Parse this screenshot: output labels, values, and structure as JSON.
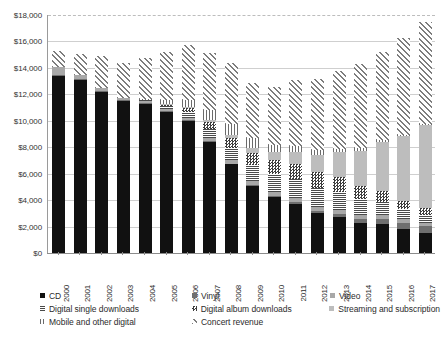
{
  "chart_data": {
    "type": "bar",
    "stacked": true,
    "title": "",
    "subtitle": "",
    "xlabel": "",
    "ylabel": "",
    "ylim": [
      0,
      18000
    ],
    "ytick_step": 2000,
    "grid": true,
    "legend_position": "bottom",
    "y_ticks": [
      "$0",
      "$2,000",
      "$4,000",
      "$6,000",
      "$8,000",
      "$10,000",
      "$12,000",
      "$14,000",
      "$16,000",
      "$18,000"
    ],
    "categories": [
      "2000",
      "2001",
      "2002",
      "2003",
      "2004",
      "2005",
      "2006",
      "2007",
      "2008",
      "2009",
      "2010",
      "2011",
      "2012",
      "2013",
      "2014",
      "2015",
      "2016",
      "2017"
    ],
    "series": [
      {
        "name": "CD",
        "pattern": "solid-black",
        "color": "#111111",
        "values": [
          13400,
          13100,
          12200,
          11500,
          11300,
          10700,
          10000,
          8400,
          6700,
          5100,
          4200,
          3700,
          3000,
          2700,
          2300,
          2200,
          1800,
          1500
        ]
      },
      {
        "name": "Vinyl",
        "pattern": "solid-dark-gray",
        "color": "#6f6f6f",
        "values": [
          60,
          60,
          50,
          50,
          40,
          40,
          40,
          50,
          60,
          80,
          100,
          130,
          180,
          230,
          300,
          400,
          450,
          520
        ]
      },
      {
        "name": "Video",
        "pattern": "solid-gray",
        "color": "#a8a8a8",
        "values": [
          640,
          320,
          260,
          200,
          180,
          180,
          200,
          250,
          270,
          280,
          300,
          330,
          320,
          300,
          300,
          300,
          300,
          280
        ]
      },
      {
        "name": "Digital single downloads",
        "pattern": "horizontal-lines",
        "color": "#4a4a4a",
        "values": [
          0,
          0,
          0,
          0,
          30,
          180,
          420,
          700,
          950,
          1200,
          1350,
          1450,
          1450,
          1350,
          1150,
          950,
          750,
          600
        ]
      },
      {
        "name": "Digital album downloads",
        "pattern": "checker",
        "color": "#3d3d3d",
        "values": [
          0,
          0,
          0,
          0,
          20,
          120,
          300,
          500,
          700,
          900,
          1050,
          1150,
          1200,
          1150,
          1000,
          850,
          650,
          500
        ]
      },
      {
        "name": "Streaming and subscription",
        "pattern": "solid-light-gray",
        "color": "#bdbdbd",
        "values": [
          0,
          0,
          0,
          0,
          0,
          40,
          90,
          160,
          260,
          420,
          620,
          900,
          1300,
          1900,
          2700,
          3700,
          4900,
          6300
        ]
      },
      {
        "name": "Mobile and other digital",
        "pattern": "vertical-lines",
        "color": "#6b6b6b",
        "values": [
          0,
          0,
          0,
          0,
          60,
          280,
          560,
          760,
          820,
          700,
          560,
          430,
          320,
          230,
          170,
          130,
          100,
          80
        ]
      },
      {
        "name": "Concert revenue",
        "pattern": "diagonal-hatch",
        "color": "#7d7d7d",
        "values": [
          1200,
          1600,
          2400,
          2600,
          3100,
          3700,
          4100,
          4300,
          4600,
          4200,
          4400,
          5000,
          5400,
          5900,
          6400,
          6700,
          7300,
          7700
        ]
      }
    ]
  },
  "legend": {
    "rows": [
      [
        {
          "label": "CD",
          "pattern": "solid-black"
        },
        {
          "label": "Vinyl",
          "pattern": "solid-dark-gray"
        },
        {
          "label": "Video",
          "pattern": "solid-gray"
        }
      ],
      [
        {
          "label": "Digital single downloads",
          "pattern": "horizontal-lines"
        },
        {
          "label": "Digital album downloads",
          "pattern": "checker"
        },
        {
          "label": "Streaming and subscription",
          "pattern": "solid-light-gray"
        }
      ],
      [
        {
          "label": "Mobile and other digital",
          "pattern": "vertical-lines"
        },
        {
          "label": "Concert revenue",
          "pattern": "diagonal-hatch"
        }
      ]
    ]
  }
}
